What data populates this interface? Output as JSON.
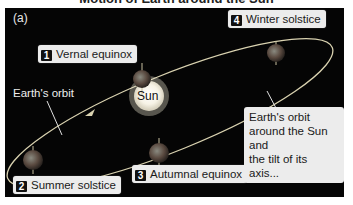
{
  "figure_title": "Motion of Earth around the Sun",
  "panel_label": "(a)",
  "orbit_label": "Earth's orbit",
  "sun_label": "Sun",
  "note": [
    "Earth's orbit",
    "around the Sun and",
    "the tilt of its axis..."
  ],
  "positions": [
    {
      "number": "1",
      "label": "Vernal equinox"
    },
    {
      "number": "2",
      "label": "Summer solstice"
    },
    {
      "number": "3",
      "label": "Autumnal equinox"
    },
    {
      "number": "4",
      "label": "Winter solstice"
    }
  ],
  "colors": {
    "background": "#050505",
    "label_box": "#ececec",
    "orbit": "#d9d2b0",
    "sun_core": "#ffffff",
    "sun_glow": "#f4efd8"
  }
}
